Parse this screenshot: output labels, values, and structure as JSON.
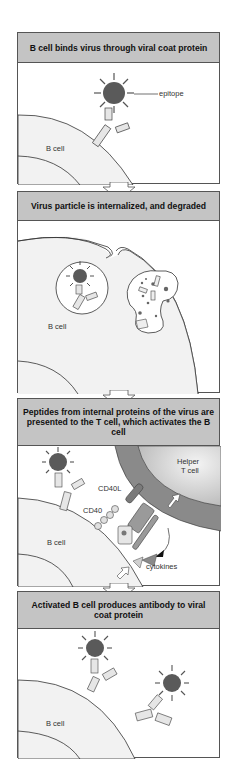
{
  "figure": {
    "panels": [
      {
        "title": "B cell binds virus through viral coat protein",
        "labels": {
          "cell": "B cell",
          "epitope": "epitope"
        }
      },
      {
        "title": "Virus particle is internalized, and degraded",
        "labels": {
          "cell": "B cell"
        }
      },
      {
        "title": "Peptides from internal proteins of the virus are presented to the T cell, which activates the B cell",
        "labels": {
          "cell": "B cell",
          "t_cell": "Helper T cell",
          "cd40l": "CD40L",
          "cd40": "CD40",
          "cytokines": "cytokines"
        }
      },
      {
        "title": "Activated B cell produces antibody to viral coat protein",
        "labels": {
          "cell": "B cell"
        }
      }
    ],
    "colors": {
      "header_bg": "#c4c4c4",
      "cell_fill": "#f2f2f2",
      "virus_fill": "#5a5a5a",
      "antibody_fill": "#e6e6e6",
      "t_cell_membrane": "#8a8a8a",
      "t_cell_fill": "#d8d8d8"
    }
  }
}
